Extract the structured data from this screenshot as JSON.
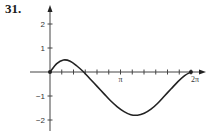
{
  "problem_number": "31.",
  "chart_data": {
    "type": "line",
    "title": "",
    "xlabel": "",
    "ylabel": "",
    "xlim": [
      0,
      6.55
    ],
    "ylim": [
      -2.4,
      2.7
    ],
    "x_ticks_count_per_pi": 6,
    "x_tick_labels": [
      {
        "value": 3.14159,
        "label": "π"
      },
      {
        "value": 6.28319,
        "label": "2π"
      }
    ],
    "y_ticks": [
      {
        "value": 2,
        "label": "2"
      },
      {
        "value": 1,
        "label": "1"
      },
      {
        "value": -1,
        "label": "−1"
      },
      {
        "value": -2,
        "label": "−2"
      }
    ],
    "series": [
      {
        "name": "curve",
        "x": [
          0,
          0.3,
          0.6,
          0.9,
          1.2,
          1.5,
          1.8,
          2.1,
          2.4,
          2.7,
          3.0,
          3.3,
          3.6,
          3.9,
          4.2,
          4.5,
          4.8,
          5.1,
          5.4,
          5.7,
          6.0,
          6.28
        ],
        "y": [
          0,
          0.35,
          0.5,
          0.45,
          0.25,
          0.0,
          -0.3,
          -0.6,
          -0.9,
          -1.2,
          -1.45,
          -1.65,
          -1.78,
          -1.8,
          -1.72,
          -1.55,
          -1.3,
          -1.0,
          -0.7,
          -0.4,
          -0.15,
          0
        ]
      }
    ],
    "grid": false,
    "legend": "none"
  }
}
